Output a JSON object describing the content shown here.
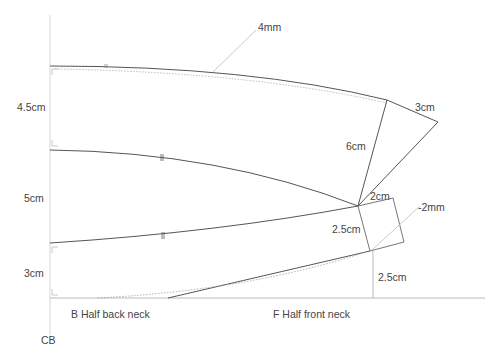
{
  "diagram": {
    "type": "pattern-draft",
    "colors": {
      "line": "#555555",
      "guide": "#bbbbbb",
      "dotted": "#999999",
      "text": "#444444"
    },
    "labels": {
      "top_ease": "4mm",
      "collar_tip": "3cm",
      "stand_height": "6cm",
      "left_top": "4.5cm",
      "left_mid": "5cm",
      "left_bottom": "3cm",
      "square_width": "2cm",
      "square_height": "2.5cm",
      "front_adjust": "-2mm",
      "front_rise": "2.5cm",
      "back_neck": "B  Half back neck",
      "front_neck": "F  Half front neck",
      "center_back": "CB"
    }
  }
}
